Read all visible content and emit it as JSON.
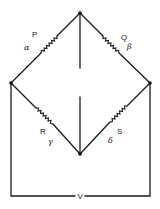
{
  "diagram": {
    "type": "wheatstone-bridge",
    "resistors": [
      {
        "id": "P",
        "label": "P",
        "greek": "α",
        "arm": "top-left"
      },
      {
        "id": "Q",
        "label": "Q",
        "greek": "β",
        "arm": "top-right"
      },
      {
        "id": "R",
        "label": "R",
        "greek": "γ",
        "arm": "bottom-left"
      },
      {
        "id": "S",
        "label": "S",
        "greek": "δ",
        "arm": "bottom-right"
      }
    ],
    "source_label": "V"
  }
}
